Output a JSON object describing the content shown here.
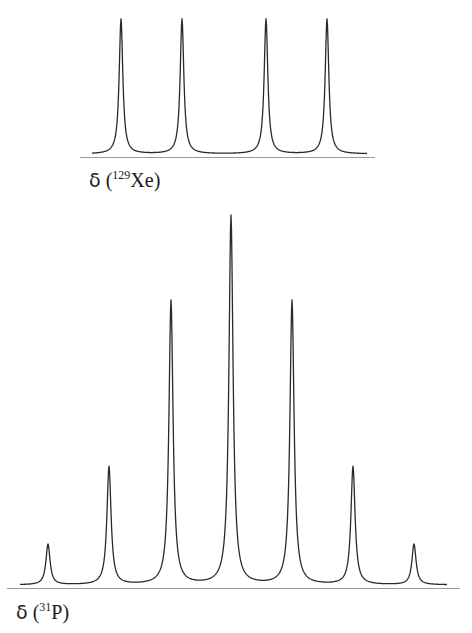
{
  "chart_data": [
    {
      "type": "line",
      "title": "",
      "xlabel_symbol": "δ",
      "xlabel_open": " (",
      "xlabel_isotope_mass": "129",
      "xlabel_nucleus": "Xe",
      "xlabel_close": ")",
      "xlabel": "δ (129Xe)",
      "ylabel": "",
      "grid": false,
      "legend": null,
      "description": "Doublet of doublets (4 equal-intensity lines)",
      "peaks": [
        {
          "x_px": 121,
          "relative_intensity": 1.0
        },
        {
          "x_px": 182,
          "relative_intensity": 1.0
        },
        {
          "x_px": 266,
          "relative_intensity": 1.0
        },
        {
          "x_px": 327,
          "relative_intensity": 1.0
        }
      ],
      "layout": {
        "baseline_y": 156,
        "peak_top_y": 19,
        "axis_x": [
          80,
          375
        ],
        "trace_x": [
          92,
          367
        ],
        "linewidth": 1.3,
        "width": 2.2
      }
    },
    {
      "type": "line",
      "title": "",
      "xlabel_symbol": "δ",
      "xlabel_open": " (",
      "xlabel_isotope_mass": "31",
      "xlabel_nucleus": "P",
      "xlabel_close": ")",
      "xlabel": "δ (31P)",
      "ylabel": "",
      "grid": false,
      "legend": null,
      "description": "Septet (1:6:15:20:15:6:1 pattern)",
      "peaks": [
        {
          "x_px": 48,
          "relative_intensity": 0.11
        },
        {
          "x_px": 109,
          "relative_intensity": 0.32
        },
        {
          "x_px": 171,
          "relative_intensity": 0.77
        },
        {
          "x_px": 231,
          "relative_intensity": 1.0
        },
        {
          "x_px": 292,
          "relative_intensity": 0.77
        },
        {
          "x_px": 353,
          "relative_intensity": 0.32
        },
        {
          "x_px": 414,
          "relative_intensity": 0.11
        }
      ],
      "layout": {
        "baseline_y": 587,
        "peak_top_y": 216,
        "axis_x": [
          7,
          460
        ],
        "trace_x": [
          20,
          447
        ],
        "linewidth": 1.3,
        "width": 2.5
      }
    }
  ],
  "colors": {
    "trace": "#2a2a2a",
    "axis": "#9a9a9a",
    "background": "#ffffff"
  }
}
